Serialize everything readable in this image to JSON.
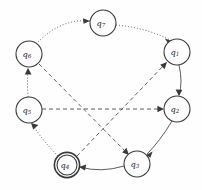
{
  "diagram": {
    "background_color": "#fefefe",
    "node_stroke_color": "#3a3a3a",
    "node_fill_color": "#fdfdfd",
    "edge_color": "#4a4a4a",
    "nodes": [
      {
        "id": "q1",
        "label": "q",
        "sub": "1",
        "cx": 177,
        "cy": 52,
        "r": 13,
        "accepting": false
      },
      {
        "id": "q2",
        "label": "q",
        "sub": "2",
        "cx": 177,
        "cy": 109,
        "r": 13,
        "accepting": false
      },
      {
        "id": "q3",
        "label": "q",
        "sub": "3",
        "cx": 137,
        "cy": 164,
        "r": 13,
        "accepting": false
      },
      {
        "id": "q4",
        "label": "q",
        "sub": "4",
        "cx": 67,
        "cy": 165,
        "r": 12,
        "accepting": true
      },
      {
        "id": "q5",
        "label": "q",
        "sub": "5",
        "cx": 29,
        "cy": 110,
        "r": 13,
        "accepting": false
      },
      {
        "id": "q6",
        "label": "q",
        "sub": "6",
        "cx": 29,
        "cy": 54,
        "r": 13,
        "accepting": false
      },
      {
        "id": "q7",
        "label": "q",
        "sub": "7",
        "cx": 103,
        "cy": 23,
        "r": 13,
        "accepting": false
      }
    ],
    "edges": [
      {
        "id": "e-q6-q7",
        "from": "q6",
        "to": "q7",
        "style": "dotted",
        "label": ""
      },
      {
        "id": "e-q7-q1",
        "from": "q7",
        "to": "q1",
        "style": "dotted",
        "label": ""
      },
      {
        "id": "e-q1-q2",
        "from": "q1",
        "to": "q2",
        "style": "solid",
        "label": ""
      },
      {
        "id": "e-q2-q3",
        "from": "q2",
        "to": "q3",
        "style": "solid",
        "label": ""
      },
      {
        "id": "e-q3-q4",
        "from": "q3",
        "to": "q4",
        "style": "solid",
        "label": ""
      },
      {
        "id": "e-q4-q5",
        "from": "q4",
        "to": "q5",
        "style": "dotted",
        "label": ""
      },
      {
        "id": "e-q5-q6",
        "from": "q5",
        "to": "q6",
        "style": "dotted",
        "label": ""
      },
      {
        "id": "e-q5-q2",
        "from": "q5",
        "to": "q2",
        "style": "dashed",
        "label": ""
      },
      {
        "id": "e-q6-q3",
        "from": "q6",
        "to": "q3",
        "style": "dashed",
        "label": ""
      },
      {
        "id": "e-q4-q1",
        "from": "q4",
        "to": "q1",
        "style": "dashed",
        "label": ""
      }
    ],
    "legend": {
      "accepting_state": "q4"
    }
  }
}
